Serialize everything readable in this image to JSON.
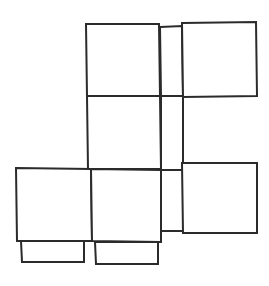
{
  "document": {
    "title": "Cube Net Line Drawing",
    "type": "line-drawing",
    "subject": "unfolded box / cube net",
    "canvas": {
      "width": 269,
      "height": 286
    },
    "background_color": "#ffffff"
  },
  "style": {
    "stroke_color": "#2b2b2b",
    "stroke_width": 2,
    "fill_color": "#ffffff",
    "line_join": "miter"
  },
  "shapes": [
    {
      "id": "top-face",
      "name": "top-square-panel",
      "role": "square face",
      "points": "86,24 159,24 160,96 87,96"
    },
    {
      "id": "top-right-flap",
      "name": "top-right-connector-strip",
      "role": "narrow connector strip",
      "points": "160,27 182,26 183,96 161,96"
    },
    {
      "id": "top-right-face",
      "name": "top-right-square-panel",
      "role": "square face",
      "points": "182,23 256,22 257,96 183,97"
    },
    {
      "id": "middle-face",
      "name": "center-square-panel",
      "role": "square face",
      "points": "87,96 160,96 161,169 88,169"
    },
    {
      "id": "middle-right-strip",
      "name": "center-right-connector-strip",
      "role": "narrow connector strip",
      "points": "161,96 183,96 183,170 161,170"
    },
    {
      "id": "bottom-left-face",
      "name": "bottom-left-square-panel",
      "role": "square face",
      "points": "16,168 91,169 92,241 17,241"
    },
    {
      "id": "bottom-center-face",
      "name": "bottom-center-square-panel",
      "role": "square face",
      "points": "91,169 161,170 161,242 92,241"
    },
    {
      "id": "bottom-right-strip",
      "name": "bottom-right-connector-strip",
      "role": "narrow connector strip",
      "points": "161,170 183,170 183,231 161,231"
    },
    {
      "id": "bottom-right-face",
      "name": "bottom-right-square-panel",
      "role": "square face",
      "points": "182,163 257,163 257,233 183,233"
    },
    {
      "id": "bottom-left-tab",
      "name": "bottom-left-glue-tab",
      "role": "rectangular glue tab",
      "points": "21,241 84,241 84,262 22,262"
    },
    {
      "id": "bottom-center-tab",
      "name": "bottom-center-glue-tab",
      "role": "rectangular glue tab",
      "points": "95,242 158,242 158,264 96,264"
    }
  ],
  "counts": {
    "square_faces": 6,
    "connector_strips": 3,
    "glue_tabs": 2,
    "total_shapes": 11
  }
}
